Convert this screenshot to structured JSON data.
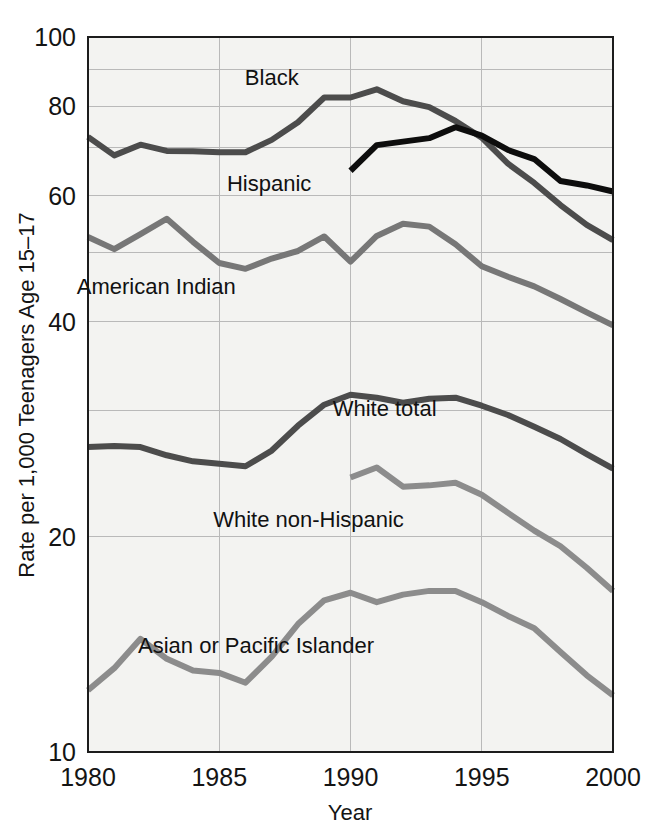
{
  "chart_data": {
    "type": "line",
    "title": "",
    "xlabel": "Year",
    "ylabel": "Rate per 1,000 Teenagers Age 15–17",
    "yscale": "log",
    "ylim": [
      10,
      100
    ],
    "xlim": [
      1980,
      2000
    ],
    "grid": true,
    "legend_position": "inline-labels",
    "y_tick_labels": [
      "100",
      "80",
      "60",
      "40",
      "20",
      "10"
    ],
    "y_ticks": [
      100,
      80,
      60,
      40,
      20,
      10
    ],
    "y_gridlines": [
      100,
      90,
      80,
      70,
      60,
      50,
      40,
      30,
      20,
      10
    ],
    "x_tick_labels": [
      "1980",
      "1985",
      "1990",
      "1995",
      "2000"
    ],
    "x_ticks": [
      1980,
      1985,
      1990,
      1995,
      2000
    ],
    "x_gridlines": [
      1985,
      1990,
      1995
    ],
    "x": [
      1980,
      1981,
      1982,
      1983,
      1984,
      1985,
      1986,
      1987,
      1988,
      1989,
      1990,
      1991,
      1992,
      1993,
      1994,
      1995,
      1996,
      1997,
      1998,
      1999,
      2000
    ],
    "series": [
      {
        "name": "Black",
        "color": "#4c4c4c",
        "width": 6,
        "label": "Black",
        "label_x": 1987.0,
        "label_y": 88.0,
        "x": [
          1980,
          1981,
          1982,
          1983,
          1984,
          1985,
          1986,
          1987,
          1988,
          1989,
          1990,
          1991,
          1992,
          1993,
          1994,
          1995,
          1996,
          1997,
          1998,
          1999,
          2000
        ],
        "values": [
          72.5,
          68.3,
          70.7,
          69.3,
          69.2,
          69.0,
          69.0,
          71.8,
          76.0,
          82.3,
          82.3,
          84.5,
          81.3,
          79.8,
          76.3,
          72.3,
          66.5,
          62.5,
          58.2,
          54.6,
          52.0
        ]
      },
      {
        "name": "Hispanic",
        "color": "#0d0d0d",
        "width": 6,
        "label": "Hispanic",
        "label_x": 1986.9,
        "label_y": 62.5,
        "x": [
          1990,
          1991,
          1992,
          1993,
          1994,
          1995,
          1996,
          1997,
          1998,
          1999,
          2000
        ],
        "values": [
          65.0,
          70.6,
          71.4,
          72.2,
          74.8,
          72.8,
          69.5,
          67.5,
          62.9,
          62.0,
          60.8
        ]
      },
      {
        "name": "American Indian",
        "color": "#777777",
        "width": 6,
        "label": "American Indian",
        "label_x": 1982.6,
        "label_y": 44.8,
        "x": [
          1980,
          1981,
          1982,
          1983,
          1984,
          1985,
          1986,
          1987,
          1988,
          1989,
          1990,
          1991,
          1992,
          1993,
          1994,
          1995,
          1996,
          1997,
          1998,
          1999,
          2000
        ],
        "values": [
          52.5,
          50.5,
          53.0,
          55.7,
          51.7,
          48.3,
          47.4,
          49.0,
          50.2,
          52.6,
          48.5,
          52.7,
          54.8,
          54.3,
          51.3,
          47.8,
          46.2,
          44.8,
          43.0,
          41.2,
          39.5
        ]
      },
      {
        "name": "White total",
        "color": "#4c4c4c",
        "width": 6,
        "label": "White total",
        "label_x": 1991.3,
        "label_y": 30.3,
        "x": [
          1980,
          1981,
          1982,
          1983,
          1984,
          1985,
          1986,
          1987,
          1988,
          1989,
          1990,
          1991,
          1992,
          1993,
          1994,
          1995,
          1996,
          1997,
          1998,
          1999,
          2000
        ],
        "values": [
          26.7,
          26.8,
          26.7,
          26.0,
          25.5,
          25.3,
          25.1,
          26.4,
          28.6,
          30.6,
          31.6,
          31.3,
          30.8,
          31.2,
          31.3,
          30.5,
          29.6,
          28.5,
          27.4,
          26.1,
          24.9
        ]
      },
      {
        "name": "White non-Hispanic",
        "color": "#8c8c8c",
        "width": 6,
        "label": "White non-Hispanic",
        "label_x": 1988.4,
        "label_y": 21.2,
        "x": [
          1990,
          1991,
          1992,
          1993,
          1994,
          1995,
          1996,
          1997,
          1998,
          1999,
          2000
        ],
        "values": [
          24.2,
          25.0,
          23.5,
          23.6,
          23.8,
          22.9,
          21.6,
          20.4,
          19.4,
          18.1,
          16.8
        ]
      },
      {
        "name": "Asian or Pacific Islander",
        "color": "#8c8c8c",
        "width": 6,
        "label": "Asian or Pacific Islander",
        "label_x": 1986.4,
        "label_y": 14.1,
        "x": [
          1980,
          1981,
          1982,
          1983,
          1984,
          1985,
          1986,
          1987,
          1988,
          1989,
          1990,
          1991,
          1992,
          1993,
          1994,
          1995,
          1996,
          1997,
          1998,
          1999,
          2000
        ],
        "values": [
          12.2,
          13.1,
          14.4,
          13.5,
          13.0,
          12.9,
          12.5,
          13.6,
          15.1,
          16.3,
          16.7,
          16.2,
          16.6,
          16.8,
          16.8,
          16.2,
          15.5,
          14.9,
          13.8,
          12.8,
          12.0
        ]
      }
    ]
  }
}
